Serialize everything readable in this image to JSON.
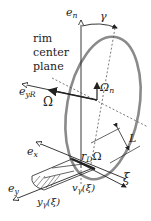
{
  "diagram": {
    "labels": {
      "e_n": {
        "base": "e",
        "sub": "n"
      },
      "gamma": "γ",
      "rim_center_plane": [
        "rim",
        "center",
        "plane"
      ],
      "omega_n": {
        "base": "Ω",
        "sub": "n"
      },
      "e_yR": {
        "base": "e",
        "sub": "yR"
      },
      "omega": "Ω",
      "L": "L",
      "e_x": {
        "base": "e",
        "sub": "x"
      },
      "rD_omega": {
        "base": "r",
        "sub": "D",
        "tail": "Ω"
      },
      "xi": "ξ",
      "e_y": {
        "base": "e",
        "sub": "y"
      },
      "v_gamma": {
        "base": "v",
        "sub": "γ",
        "tail": "(ξ)"
      },
      "y_gamma": {
        "base": "y",
        "sub": "γ",
        "tail": "(ξ)"
      }
    },
    "colors": {
      "rim": "#8a8a8a",
      "lines": "#222222",
      "dashed": "#555555"
    }
  }
}
